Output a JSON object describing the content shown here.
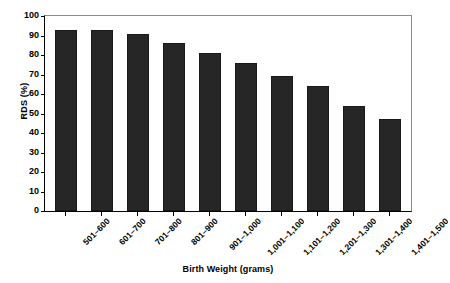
{
  "chart_data": {
    "type": "bar",
    "title": "",
    "xlabel": "Birth Weight (grams)",
    "ylabel": "RDS (%)",
    "categories": [
      "501–600",
      "601–700",
      "701–800",
      "801–900",
      "901–1,000",
      "1,001–1,100",
      "1,101–1,200",
      "1,201–1,300",
      "1,301–1,400",
      "1,401–1,500"
    ],
    "values": [
      93,
      93,
      91,
      86,
      81,
      76,
      69,
      64,
      54,
      47
    ],
    "ylim": [
      0,
      100
    ],
    "yticks": [
      0,
      10,
      20,
      30,
      40,
      50,
      60,
      70,
      80,
      90,
      100
    ],
    "ytick_labels": [
      "0",
      "10",
      "20",
      "30",
      "40",
      "50",
      "60",
      "70",
      "80",
      "90",
      "100"
    ],
    "grid": false,
    "legend": null,
    "bar_color": "#262626",
    "axis_color": "#000000",
    "background": "#ffffff"
  }
}
